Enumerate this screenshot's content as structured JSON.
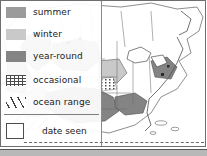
{
  "colors": {
    "summer": "#9b9b9b",
    "winter": "#c9c9c9",
    "year_round": "#848484",
    "occasional_dot": "#4a4a4a",
    "ocean_hatch": "#3d3d3d",
    "land_base": "#ffffff",
    "outline": "#6e6e6e",
    "text": "#1a1a1a",
    "base_bar": "#b8b8b8"
  },
  "legend": {
    "items": [
      {
        "label": "summer",
        "swatch": "solid",
        "swatch_name": "summer-swatch"
      },
      {
        "label": "winter",
        "swatch": "solid",
        "swatch_name": "winter-swatch"
      },
      {
        "label": "year-round",
        "swatch": "solid",
        "swatch_name": "year-round-swatch"
      },
      {
        "label": "occasional",
        "swatch": "dots",
        "swatch_name": "occasional-swatch"
      },
      {
        "label": "ocean range",
        "swatch": "hatch",
        "swatch_name": "ocean-range-swatch"
      }
    ],
    "date_seen": {
      "label": "date seen",
      "box_value": ""
    }
  },
  "map": {
    "region": "North America",
    "shaded_areas": [
      {
        "name": "western-interior",
        "fill": "summer"
      },
      {
        "name": "northern-plains",
        "fill": "summer"
      },
      {
        "name": "southeast-gulf",
        "fill": "year_round"
      },
      {
        "name": "southwest",
        "fill": "winter"
      },
      {
        "name": "pacific-ocean",
        "fill": "ocean_hatch"
      }
    ]
  }
}
